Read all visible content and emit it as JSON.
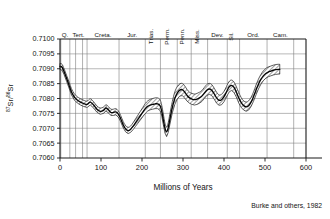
{
  "figure": {
    "credit": "Burke and others, 1982"
  },
  "chart_data": {
    "type": "line",
    "title": "",
    "xlabel": "Millions of Years",
    "ylabel": "87Sr/86Sr",
    "ylabel_parts": {
      "sup1": "87",
      "mid": "Sr/",
      "sup2": "86",
      "tail": "Sr"
    },
    "xlim": [
      0,
      600
    ],
    "ylim": [
      0.706,
      0.71
    ],
    "grid": true,
    "legend": "none",
    "xticks": [
      0,
      100,
      200,
      300,
      400,
      500,
      600
    ],
    "xtick_labels": [
      "0",
      "100",
      "200",
      "300",
      "400",
      "500",
      "600"
    ],
    "yticks": [
      0.706,
      0.7065,
      0.707,
      0.7075,
      0.708,
      0.7085,
      0.709,
      0.7095,
      0.71
    ],
    "ytick_labels": [
      "0.7060",
      "0.7065",
      "0.7070",
      "0.7075",
      "0.7080",
      "0.7085",
      "0.7090",
      "0.7095",
      "0.7100"
    ],
    "period_boundaries": [
      2,
      24,
      38,
      55,
      66,
      144,
      208,
      245,
      286,
      320,
      360,
      408,
      438,
      505,
      570
    ],
    "periods": [
      {
        "label": "Q.",
        "start": 0,
        "end": 24,
        "rotated": false
      },
      {
        "label": "Tert.",
        "start": 24,
        "end": 66,
        "rotated": false
      },
      {
        "label": "Creta.",
        "start": 66,
        "end": 144,
        "rotated": false
      },
      {
        "label": "Jur.",
        "start": 144,
        "end": 208,
        "rotated": false
      },
      {
        "label": "Trias.",
        "start": 208,
        "end": 245,
        "rotated": true
      },
      {
        "label": "Perm.",
        "start": 245,
        "end": 286,
        "rotated": true
      },
      {
        "label": "Penn.",
        "start": 286,
        "end": 320,
        "rotated": true
      },
      {
        "label": "Miss.",
        "start": 320,
        "end": 360,
        "rotated": true
      },
      {
        "label": "Dev.",
        "start": 360,
        "end": 408,
        "rotated": false
      },
      {
        "label": "Sil.",
        "start": 408,
        "end": 438,
        "rotated": true
      },
      {
        "label": "Ord.",
        "start": 438,
        "end": 505,
        "rotated": false
      },
      {
        "label": "Cam.",
        "start": 505,
        "end": 570,
        "rotated": false
      }
    ],
    "series": [
      {
        "name": "87Sr/86Sr seawater curve (mean)",
        "x": [
          0,
          5,
          10,
          16,
          22,
          28,
          35,
          42,
          50,
          58,
          66,
          74,
          82,
          90,
          98,
          106,
          112,
          118,
          124,
          130,
          136,
          142,
          148,
          154,
          160,
          166,
          172,
          178,
          184,
          190,
          196,
          202,
          208,
          214,
          220,
          226,
          232,
          238,
          244,
          248,
          252,
          256,
          260,
          264,
          268,
          274,
          280,
          286,
          292,
          298,
          304,
          310,
          316,
          322,
          328,
          334,
          340,
          346,
          352,
          358,
          364,
          370,
          376,
          382,
          388,
          394,
          400,
          406,
          412,
          418,
          424,
          430,
          436,
          442,
          448,
          454,
          460,
          466,
          472,
          478,
          484,
          490,
          496,
          502,
          508,
          514,
          520,
          526,
          532,
          536
        ],
        "values": [
          0.70908,
          0.70905,
          0.7089,
          0.70868,
          0.70845,
          0.70822,
          0.70805,
          0.70795,
          0.70788,
          0.70783,
          0.7078,
          0.70788,
          0.70778,
          0.70764,
          0.70757,
          0.7076,
          0.70768,
          0.70762,
          0.70753,
          0.70753,
          0.70755,
          0.70748,
          0.70732,
          0.70712,
          0.70698,
          0.70692,
          0.70696,
          0.70706,
          0.70718,
          0.7073,
          0.70742,
          0.70754,
          0.70766,
          0.70774,
          0.70778,
          0.7078,
          0.70782,
          0.70782,
          0.70776,
          0.70758,
          0.70728,
          0.707,
          0.70688,
          0.70702,
          0.7073,
          0.7077,
          0.708,
          0.70818,
          0.70828,
          0.7083,
          0.70822,
          0.7081,
          0.70802,
          0.70798,
          0.70796,
          0.70798,
          0.70802,
          0.70808,
          0.70818,
          0.70828,
          0.70832,
          0.70828,
          0.70816,
          0.70802,
          0.70794,
          0.70796,
          0.70806,
          0.70822,
          0.70838,
          0.70844,
          0.70838,
          0.70822,
          0.70802,
          0.70786,
          0.70776,
          0.70772,
          0.70776,
          0.70788,
          0.70806,
          0.70828,
          0.70848,
          0.70864,
          0.70876,
          0.70884,
          0.70889,
          0.70892,
          0.70895,
          0.70897,
          0.70898,
          0.70898
        ],
        "upper": [
          0.70918,
          0.70915,
          0.709,
          0.70878,
          0.70856,
          0.70833,
          0.70816,
          0.70806,
          0.70799,
          0.70794,
          0.70791,
          0.70799,
          0.70789,
          0.70775,
          0.70768,
          0.70771,
          0.70779,
          0.70773,
          0.70764,
          0.70764,
          0.70766,
          0.70759,
          0.70743,
          0.70723,
          0.70709,
          0.70703,
          0.70707,
          0.70718,
          0.70731,
          0.70744,
          0.70757,
          0.7077,
          0.70783,
          0.70792,
          0.70797,
          0.708,
          0.70802,
          0.70802,
          0.70796,
          0.70778,
          0.70748,
          0.70717,
          0.70704,
          0.70719,
          0.70748,
          0.7079,
          0.70822,
          0.7084,
          0.70849,
          0.70851,
          0.70843,
          0.7083,
          0.70821,
          0.70817,
          0.70815,
          0.70817,
          0.70821,
          0.70827,
          0.70837,
          0.70847,
          0.70851,
          0.70847,
          0.70835,
          0.70821,
          0.70812,
          0.70814,
          0.70824,
          0.7084,
          0.70856,
          0.70862,
          0.70856,
          0.7084,
          0.7082,
          0.70803,
          0.70792,
          0.70788,
          0.70792,
          0.70804,
          0.70822,
          0.70845,
          0.70865,
          0.70881,
          0.70893,
          0.70901,
          0.70906,
          0.70909,
          0.70912,
          0.70914,
          0.70915,
          0.70915
        ],
        "lower": [
          0.70898,
          0.70895,
          0.7088,
          0.70858,
          0.70835,
          0.70812,
          0.70795,
          0.70785,
          0.70778,
          0.70773,
          0.7077,
          0.70778,
          0.70768,
          0.70754,
          0.70747,
          0.7075,
          0.70758,
          0.70752,
          0.70743,
          0.70743,
          0.70745,
          0.70738,
          0.70722,
          0.70702,
          0.70688,
          0.70682,
          0.70686,
          0.70695,
          0.70706,
          0.70717,
          0.70728,
          0.70739,
          0.7075,
          0.70758,
          0.70762,
          0.70764,
          0.70766,
          0.70766,
          0.7076,
          0.70742,
          0.70712,
          0.70684,
          0.70672,
          0.70686,
          0.70713,
          0.70752,
          0.7078,
          0.70798,
          0.70808,
          0.7081,
          0.70802,
          0.70791,
          0.70784,
          0.7078,
          0.70778,
          0.7078,
          0.70784,
          0.7079,
          0.708,
          0.7081,
          0.70814,
          0.7081,
          0.70798,
          0.70784,
          0.70777,
          0.70779,
          0.70789,
          0.70805,
          0.70821,
          0.70827,
          0.70821,
          0.70805,
          0.70785,
          0.7077,
          0.70761,
          0.70757,
          0.70761,
          0.70773,
          0.70791,
          0.70812,
          0.70832,
          0.70848,
          0.7086,
          0.70868,
          0.70873,
          0.70876,
          0.70879,
          0.70881,
          0.70882,
          0.70882
        ]
      }
    ]
  }
}
